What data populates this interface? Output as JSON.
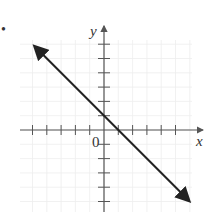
{
  "problem": {
    "number_marker": "•"
  },
  "chart_data": {
    "type": "line",
    "title": "",
    "xlabel": "x",
    "ylabel": "y",
    "origin_label": "0",
    "grid": true,
    "xlim": [
      -5.8,
      6.2
    ],
    "ylim": [
      -5.7,
      6.3
    ],
    "x_ticks": [
      -5,
      -4,
      -3,
      -2,
      -1,
      1,
      2,
      3,
      4,
      5
    ],
    "y_ticks": [
      -5,
      -4,
      -3,
      -2,
      -1,
      1,
      2,
      3,
      4,
      5,
      6
    ],
    "series": [
      {
        "name": "line",
        "equation": "y = -x + 1",
        "slope": -1,
        "y_intercept": 1,
        "x_intercept": 1,
        "x": [
          -4.8,
          0,
          1,
          5.9
        ],
        "y": [
          5.8,
          1,
          0,
          -4.9
        ],
        "arrows_both_ends": true
      }
    ]
  },
  "colors": {
    "axis": "#555555",
    "line": "#222222",
    "grid": "#eeeeee",
    "text": "#333333"
  }
}
